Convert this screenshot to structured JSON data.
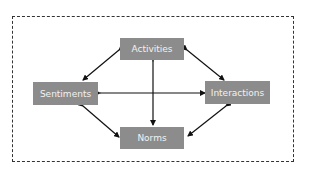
{
  "diagram": {
    "nodes": [
      {
        "id": "activities",
        "label": "Activities"
      },
      {
        "id": "sentiments",
        "label": "Sentiments"
      },
      {
        "id": "interactions",
        "label": "Interactions"
      },
      {
        "id": "norms",
        "label": "Norms"
      }
    ],
    "edges": [
      {
        "from": "activities",
        "to": "sentiments",
        "bidirectional": true
      },
      {
        "from": "activities",
        "to": "interactions",
        "bidirectional": true
      },
      {
        "from": "activities",
        "to": "norms",
        "bidirectional": true
      },
      {
        "from": "sentiments",
        "to": "interactions",
        "bidirectional": true
      },
      {
        "from": "sentiments",
        "to": "norms",
        "bidirectional": true
      },
      {
        "from": "interactions",
        "to": "norms",
        "bidirectional": true
      }
    ],
    "colors": {
      "node_fill": "#8c8c8c",
      "node_text": "#f2f2f2",
      "arrow": "#111111",
      "frame_border": "#333333"
    }
  }
}
